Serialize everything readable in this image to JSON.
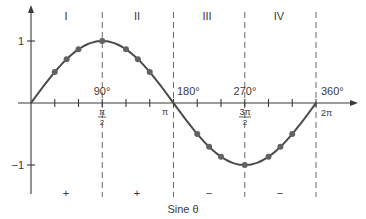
{
  "caption": "Sine θ",
  "quadrants": [
    "I",
    "II",
    "III",
    "IV"
  ],
  "degree_labels": [
    "90°",
    "180°",
    "270°",
    "360°"
  ],
  "radian_labels": {
    "half_pi_num": "π",
    "half_pi_den": "2",
    "pi": "π",
    "three_half_pi_num": "3π",
    "three_half_pi_den": "2",
    "two_pi": "2π"
  },
  "y_labels": {
    "one": "1",
    "minus_one": "−1"
  },
  "signs": [
    "+",
    "+",
    "−",
    "−"
  ],
  "colors": {
    "curve": "#4a4a4a",
    "dots": "#626262",
    "axis": "#3a3a3a",
    "dash": "#6a6a6a",
    "text": "#3a3a3a"
  },
  "chart_data": {
    "type": "line",
    "title": "Sine θ",
    "xlabel": "θ (degrees / radians)",
    "ylabel": "sin θ",
    "xlim": [
      0,
      360
    ],
    "ylim": [
      -1,
      1
    ],
    "x_ticks_degrees": [
      0,
      30,
      60,
      90,
      120,
      150,
      180,
      210,
      240,
      270,
      300,
      330,
      360
    ],
    "x_tick_labels": {
      "90": "90° / π/2",
      "180": "180° / π",
      "270": "270° / 3π/2",
      "360": "360° / 2π"
    },
    "y_tick_labels": {
      "1": "1",
      "-1": "−1"
    },
    "quadrant_signs": {
      "I": "+",
      "II": "+",
      "III": "−",
      "IV": "−"
    },
    "series": [
      {
        "name": "sin θ (curve)",
        "x": [
          0,
          30,
          45,
          60,
          90,
          120,
          135,
          150,
          180,
          210,
          225,
          240,
          270,
          300,
          315,
          330,
          360
        ],
        "values": [
          0,
          0.5,
          0.707,
          0.866,
          1,
          0.866,
          0.707,
          0.5,
          0,
          -0.5,
          -0.707,
          -0.866,
          -1,
          -0.866,
          -0.707,
          -0.5,
          0
        ]
      },
      {
        "name": "marked points",
        "x": [
          30,
          45,
          60,
          90,
          120,
          135,
          150,
          210,
          225,
          240,
          270,
          300,
          315,
          330
        ],
        "values": [
          0.5,
          0.707,
          0.866,
          1,
          0.866,
          0.707,
          0.5,
          -0.5,
          -0.707,
          -0.866,
          -1,
          -0.866,
          -0.707,
          -0.5
        ]
      }
    ],
    "grid": false,
    "legend": "none"
  }
}
